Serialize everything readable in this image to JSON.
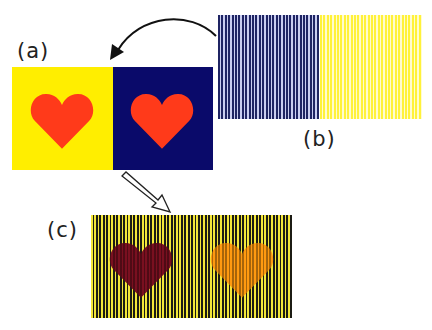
{
  "labels": {
    "a": "(a)",
    "b": "(b)",
    "c": "(c)"
  },
  "colors": {
    "yellow": "#ffee00",
    "navy": "#0a0a6a",
    "heart_red": "#ff3a1a",
    "heart_dark_red": "#7a1020",
    "heart_orange": "#ff9a10",
    "grating_dark": "#1f2463",
    "grating_yellow": "#fff23a"
  },
  "panels": {
    "a": {
      "description": "Red hearts on yellow (left) and navy blue (right) backgrounds"
    },
    "b": {
      "description": "Vertical line gratings: navy/white stripes (left) and yellow/white stripes (right)"
    },
    "c": {
      "description": "Striped yellow/black grating with a dark red heart (left) and an orange heart (right)"
    }
  },
  "arrows": {
    "curved": "from (b) to (a)",
    "hollow": "from (a) to (c)"
  }
}
